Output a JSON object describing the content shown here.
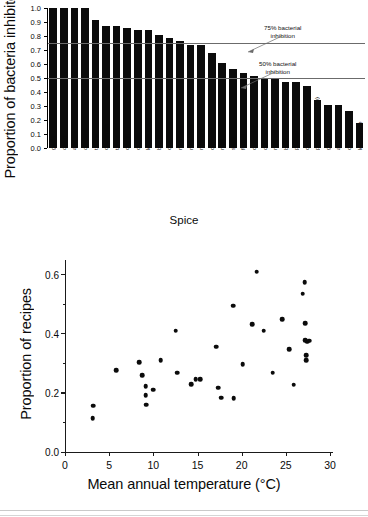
{
  "figure": {
    "background": "#ffffff",
    "ink_color": "#0b0b0b"
  },
  "chart_data": [
    {
      "type": "bar",
      "panel": "top",
      "title": "",
      "xlabel": "Spice",
      "ylabel": "Proportion of bacteria inhibited",
      "ylim": [
        0.0,
        1.0
      ],
      "ytick_labels": [
        "1.0",
        "0.9",
        "0.8",
        "0.7",
        "0.6",
        "0.5",
        "0.4",
        "0.3",
        "0.2",
        "0.1",
        "0.0"
      ],
      "yticks": [
        1.0,
        0.9,
        0.8,
        0.7,
        0.6,
        0.5,
        0.4,
        0.3,
        0.2,
        0.1,
        0.0
      ],
      "grid": false,
      "categories": [
        "garlic",
        "onion",
        "allspice",
        "oregano",
        "thyme",
        "cinnamon",
        "tarragon",
        "cumin",
        "cloves",
        "lemon grass",
        "bay leaf",
        "capsicums",
        "rosemary",
        "marjoram",
        "mustard",
        "caraway",
        "mint",
        "sage",
        "fennel",
        "coriander",
        "dill",
        "nutmeg",
        "basil",
        "parsley",
        "cardamom",
        "pepper (black/white)",
        "ginger",
        "anise seed",
        "celery seed",
        "lemon/lime"
      ],
      "values": [
        1.0,
        1.0,
        1.0,
        1.0,
        0.915,
        0.87,
        0.87,
        0.86,
        0.84,
        0.84,
        0.805,
        0.785,
        0.765,
        0.735,
        0.735,
        0.68,
        0.605,
        0.565,
        0.535,
        0.515,
        0.5,
        0.5,
        0.47,
        0.47,
        0.445,
        0.34,
        0.305,
        0.305,
        0.265,
        0.18
      ],
      "reference_lines": [
        {
          "value": 0.75,
          "label": "75% bacterial\ninhibition",
          "label_line1": "75% bacterial",
          "label_line2": "inhibition"
        },
        {
          "value": 0.5,
          "label": "50% bacterial\ninhibition",
          "label_line1": "50% bacterial",
          "label_line2": "inhibition"
        }
      ],
      "note": "last category label is clipped by the image bottom edge"
    },
    {
      "type": "scatter",
      "panel": "bottom",
      "title": "",
      "xlabel": "Mean annual temperature (°C)",
      "ylabel": "Proportion of recipes",
      "xlim": [
        0,
        30
      ],
      "ylim": [
        0.0,
        0.65
      ],
      "xtick_labels": [
        "0",
        "5",
        "10",
        "15",
        "20",
        "25",
        "30"
      ],
      "xticks": [
        0,
        5,
        10,
        15,
        20,
        25,
        30
      ],
      "ytick_labels": [
        "0.0",
        "0.2",
        "0.4",
        "0.6"
      ],
      "yticks": [
        0.0,
        0.2,
        0.4,
        0.6
      ],
      "minor_yticks": [
        0.1,
        0.3,
        0.5
      ],
      "grid": false,
      "legend": null,
      "points": [
        [
          3.0,
          0.115
        ],
        [
          3.1,
          0.157
        ],
        [
          5.7,
          0.276
        ],
        [
          8.3,
          0.303
        ],
        [
          8.6,
          0.26
        ],
        [
          9.0,
          0.223
        ],
        [
          9.0,
          0.193
        ],
        [
          9.1,
          0.16
        ],
        [
          9.9,
          0.211
        ],
        [
          10.7,
          0.311
        ],
        [
          12.4,
          0.41
        ],
        [
          12.6,
          0.268
        ],
        [
          14.2,
          0.23
        ],
        [
          14.7,
          0.246
        ],
        [
          15.2,
          0.247
        ],
        [
          17.0,
          0.357
        ],
        [
          17.2,
          0.217
        ],
        [
          17.6,
          0.184
        ],
        [
          18.9,
          0.495
        ],
        [
          19.0,
          0.183
        ],
        [
          20.0,
          0.297
        ],
        [
          21.1,
          0.433
        ],
        [
          21.6,
          0.611
        ],
        [
          22.4,
          0.411
        ],
        [
          23.4,
          0.268
        ],
        [
          24.5,
          0.449
        ],
        [
          25.3,
          0.349
        ],
        [
          25.8,
          0.228
        ],
        [
          26.8,
          0.536
        ],
        [
          27.0,
          0.574
        ],
        [
          27.1,
          0.437
        ],
        [
          27.1,
          0.378
        ],
        [
          27.3,
          0.374
        ],
        [
          27.5,
          0.377
        ],
        [
          27.2,
          0.328
        ],
        [
          27.2,
          0.31
        ]
      ],
      "note": "x tick label 30 is clipped at the right image edge, rendering as 3C"
    }
  ]
}
